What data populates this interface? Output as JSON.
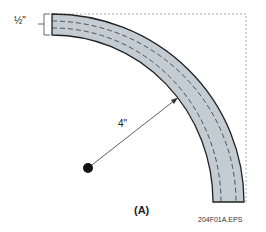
{
  "diagram": {
    "thickness_label": "½\"",
    "radius_label": "4\"",
    "caption": "(A)",
    "file_label": "204F01A.EPS",
    "colors": {
      "bend_fill": "#c3ccd3",
      "outline": "#222222",
      "guide_dots": "#999999"
    }
  }
}
